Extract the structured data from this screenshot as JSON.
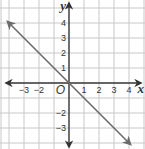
{
  "chart_data": {
    "type": "line",
    "title": "",
    "xlabel": "x",
    "ylabel": "y",
    "origin_label": "O",
    "xlim": [
      -4.4,
      5
    ],
    "ylim": [
      -4.4,
      5.5
    ],
    "grid": true,
    "x_ticks": [
      {
        "value": -3,
        "label": "−3"
      },
      {
        "value": -2,
        "label": "−2"
      },
      {
        "value": 1,
        "label": "1"
      },
      {
        "value": 2,
        "label": "2"
      },
      {
        "value": 3,
        "label": "3"
      },
      {
        "value": 4,
        "label": "4"
      }
    ],
    "y_ticks": [
      {
        "value": 4,
        "label": "4"
      },
      {
        "value": 3,
        "label": "3"
      },
      {
        "value": 2,
        "label": "2"
      },
      {
        "value": 1,
        "label": "1"
      },
      {
        "value": -2,
        "label": "−2"
      },
      {
        "value": -3,
        "label": "−3"
      }
    ],
    "series": [
      {
        "name": "y = -x",
        "equation": "y = -x",
        "points": [
          [
            -4.1,
            4.1
          ],
          [
            4.1,
            -4.1
          ]
        ],
        "arrows_both_ends": true
      }
    ],
    "colors": {
      "grid": "#c8c8c8",
      "axis": "#333333",
      "line": "#6b6b6b"
    }
  }
}
